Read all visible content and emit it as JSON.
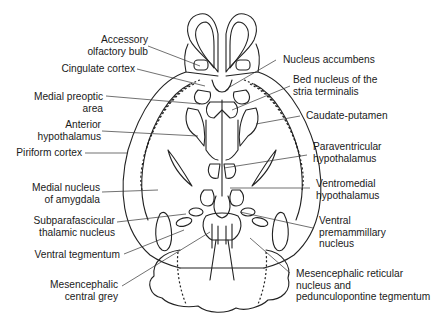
{
  "figure": {
    "labels_left": [
      {
        "id": "accessory-olfactory-bulb",
        "lines": [
          "Accessory",
          "olfactory bulb"
        ]
      },
      {
        "id": "cingulate-cortex",
        "lines": [
          "Cingulate cortex"
        ]
      },
      {
        "id": "medial-preoptic-area",
        "lines": [
          "Medial preoptic",
          "area"
        ]
      },
      {
        "id": "anterior-hypothalamus",
        "lines": [
          "Anterior",
          "hypothalamus"
        ]
      },
      {
        "id": "piriform-cortex",
        "lines": [
          "Piriform cortex"
        ]
      },
      {
        "id": "medial-nucleus-of-amygdala",
        "lines": [
          "Medial nucleus",
          "of amygdala"
        ]
      },
      {
        "id": "subparafascicular-thalamic-nucleus",
        "lines": [
          "Subparafascicular",
          "thalamic nucleus"
        ]
      },
      {
        "id": "ventral-tegmentum",
        "lines": [
          "Ventral tegmentum"
        ]
      },
      {
        "id": "mesencephalic-central-grey",
        "lines": [
          "Mesencephalic",
          "central grey"
        ]
      }
    ],
    "labels_right": [
      {
        "id": "nucleus-accumbens",
        "lines": [
          "Nucleus accumbens"
        ]
      },
      {
        "id": "bed-nucleus-stria-terminalis",
        "lines": [
          "Bed nucleus of the",
          "stria terminalis"
        ]
      },
      {
        "id": "caudate-putamen",
        "lines": [
          "Caudate-putamen"
        ]
      },
      {
        "id": "paraventricular-hypothalamus",
        "lines": [
          "Paraventricular",
          "hypothalamus"
        ]
      },
      {
        "id": "ventromedial-hypothalamus",
        "lines": [
          "Ventromedial",
          "hypothalamus"
        ]
      },
      {
        "id": "ventral-premammillary-nucleus",
        "lines": [
          "Ventral",
          "premammillary",
          "nucleus"
        ]
      },
      {
        "id": "mesencephalic-reticular-pedunculopontine",
        "lines": [
          "Mesencephalic reticular",
          "nucleus and",
          "pedunculopontine tegmentum"
        ]
      }
    ]
  }
}
